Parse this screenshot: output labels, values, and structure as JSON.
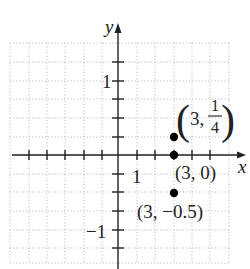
{
  "figure": {
    "x_axis_label": "x",
    "y_axis_label": "y",
    "x_tick_label": "1",
    "y_tick_labels": [
      "1",
      "−1"
    ],
    "x_tick_unit": 1,
    "y_tick_unit": 0.25,
    "points": [
      {
        "x": 3,
        "y": 0.25,
        "label_prefix": "3, ",
        "label_num": "1",
        "label_den": "4"
      },
      {
        "x": 3,
        "y": 0,
        "label": "(3, 0)"
      },
      {
        "x": 3,
        "y": -0.5,
        "label": "(3, −0.5)"
      }
    ],
    "colors": {
      "axis": "#222222",
      "grid": "#bdbdbd",
      "point": "#000000"
    }
  }
}
